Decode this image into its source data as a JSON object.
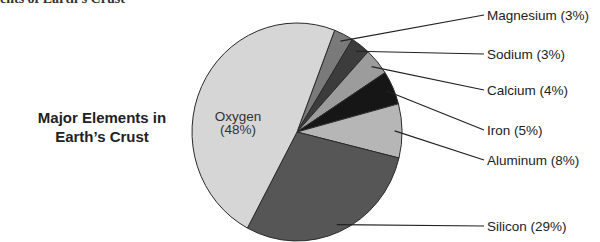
{
  "header_fragment": "ents of Earth's Crust",
  "chart_data": {
    "type": "pie",
    "title": "Major Elements in Earth’s Crust",
    "title_lines": [
      "Major Elements in",
      "Earth’s Crust"
    ],
    "start_angle_deg_clockwise_from_top": 21,
    "slices": [
      {
        "name": "Magnesium",
        "value": 3,
        "label": "Magnesium (3%)",
        "color": "#7a7a7a",
        "label_position": "outside-right"
      },
      {
        "name": "Sodium",
        "value": 3,
        "label": "Sodium (3%)",
        "color": "#3c3c3c",
        "label_position": "outside-right"
      },
      {
        "name": "Calcium",
        "value": 4,
        "label": "Calcium (4%)",
        "color": "#9c9c9c",
        "label_position": "outside-right"
      },
      {
        "name": "Iron",
        "value": 5,
        "label": "Iron (5%)",
        "color": "#161616",
        "label_position": "outside-right"
      },
      {
        "name": "Aluminum",
        "value": 8,
        "label": "Aluminum (8%)",
        "color": "#b6b6b6",
        "label_position": "outside-right"
      },
      {
        "name": "Silicon",
        "value": 29,
        "label": "Silicon (29%)",
        "color": "#565656",
        "label_position": "outside-right"
      },
      {
        "name": "Oxygen",
        "value": 48,
        "label": "Oxygen (48%)",
        "label_lines": [
          "Oxygen",
          "(48%)"
        ],
        "color": "#d6d6d6",
        "label_position": "inside"
      }
    ],
    "units": "percent"
  }
}
